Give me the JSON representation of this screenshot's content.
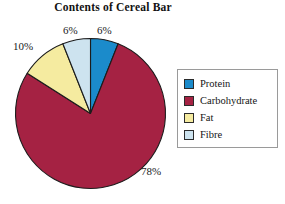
{
  "chart_data": {
    "type": "pie",
    "title": "Contents of Cereal Bar",
    "categories": [
      "Protein",
      "Carbohydrate",
      "Fat",
      "Fibre"
    ],
    "values": [
      6,
      78,
      10,
      6
    ],
    "value_labels": [
      "6%",
      "78%",
      "10%",
      "6%"
    ],
    "unit": "%",
    "colors": [
      "#1b8bcb",
      "#a52243",
      "#f5eba0",
      "#cde3ef"
    ],
    "start_angle_deg": 0,
    "direction": "clockwise",
    "legend": {
      "position": "right",
      "entries": [
        {
          "label": "Protein",
          "color": "#1b8bcb"
        },
        {
          "label": "Carbohydrate",
          "color": "#a52243"
        },
        {
          "label": "Fat",
          "color": "#f5eba0"
        },
        {
          "label": "Fibre",
          "color": "#cde3ef"
        }
      ]
    },
    "grid": false,
    "xlabel": "",
    "ylabel": ""
  },
  "labels": {
    "protein_pct": "6%",
    "carbohydrate_pct": "78%",
    "fat_pct": "10%",
    "fibre_pct": "6%"
  },
  "colors": {
    "protein": "#1b8bcb",
    "carbohydrate": "#a52243",
    "fat": "#f5eba0",
    "fibre": "#cde3ef",
    "outline": "#1c1c1c",
    "legend_border": "#9a9a9a"
  }
}
